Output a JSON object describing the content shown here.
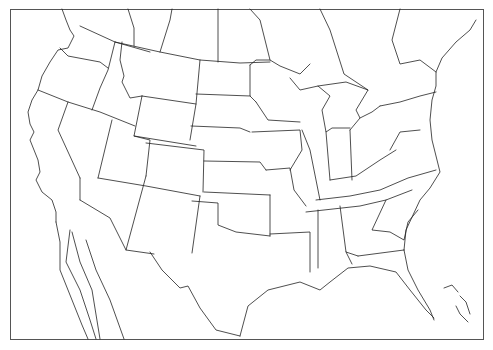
{
  "map": {
    "type": "blank outline map",
    "region": "Contiguous United States with southern Canada and northern Mexico",
    "labels": [],
    "colors": {
      "background": "#ffffff",
      "border_lines": "#222222",
      "frame": "#555555"
    }
  }
}
